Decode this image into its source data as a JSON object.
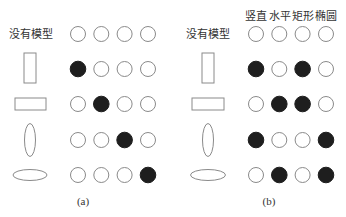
{
  "figure": {
    "colors": {
      "filled": "#1e1e1e",
      "outline": "#8a8a8a",
      "text": "#333333"
    },
    "panels": [
      {
        "id": "a",
        "caption": "(a)",
        "column_headers": [],
        "rows": [
          {
            "label": "没有模型",
            "shape": "none",
            "activations": [
              0,
              0,
              0,
              0
            ]
          },
          {
            "label": "",
            "shape": "vertical-rectangle",
            "activations": [
              1,
              0,
              0,
              0
            ]
          },
          {
            "label": "",
            "shape": "horizontal-rectangle",
            "activations": [
              0,
              1,
              0,
              0
            ]
          },
          {
            "label": "",
            "shape": "vertical-ellipse",
            "activations": [
              0,
              0,
              1,
              0
            ]
          },
          {
            "label": "",
            "shape": "horizontal-ellipse",
            "activations": [
              0,
              0,
              0,
              1
            ]
          }
        ]
      },
      {
        "id": "b",
        "caption": "(b)",
        "column_headers": [
          "竖直",
          "水平",
          "矩形",
          "椭圆"
        ],
        "rows": [
          {
            "label": "没有模型",
            "shape": "none",
            "activations": [
              0,
              0,
              0,
              0
            ]
          },
          {
            "label": "",
            "shape": "vertical-rectangle",
            "activations": [
              1,
              0,
              1,
              0
            ]
          },
          {
            "label": "",
            "shape": "horizontal-rectangle",
            "activations": [
              0,
              1,
              1,
              0
            ]
          },
          {
            "label": "",
            "shape": "vertical-ellipse",
            "activations": [
              1,
              0,
              0,
              1
            ]
          },
          {
            "label": "",
            "shape": "horizontal-ellipse",
            "activations": [
              0,
              1,
              0,
              1
            ]
          }
        ]
      }
    ]
  }
}
